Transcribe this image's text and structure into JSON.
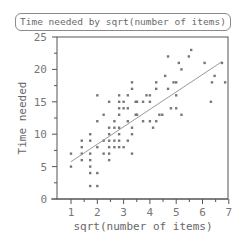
{
  "chart_data": {
    "type": "scatter",
    "title": "Time needed by sqrt(number of items)",
    "xlabel": "sqrt(number of items)",
    "ylabel": "Time needed",
    "xlim": [
      0.5,
      7
    ],
    "ylim": [
      0,
      25
    ],
    "xticks": [
      1,
      2,
      3,
      4,
      5,
      6,
      7
    ],
    "yticks": [
      0,
      5,
      10,
      15,
      20,
      25
    ],
    "grid": false,
    "legend": null,
    "points": [
      [
        1.0,
        7
      ],
      [
        1.0,
        5
      ],
      [
        1.41,
        9
      ],
      [
        1.41,
        8
      ],
      [
        1.41,
        7
      ],
      [
        1.41,
        6
      ],
      [
        1.73,
        10
      ],
      [
        1.73,
        9
      ],
      [
        1.73,
        7
      ],
      [
        1.73,
        6
      ],
      [
        1.73,
        5
      ],
      [
        1.73,
        4
      ],
      [
        1.73,
        2
      ],
      [
        2.0,
        16
      ],
      [
        2.0,
        12
      ],
      [
        2.0,
        8
      ],
      [
        2.0,
        4
      ],
      [
        2.0,
        2
      ],
      [
        2.24,
        13
      ],
      [
        2.24,
        9
      ],
      [
        2.24,
        7
      ],
      [
        2.45,
        15
      ],
      [
        2.45,
        11
      ],
      [
        2.45,
        10
      ],
      [
        2.45,
        9
      ],
      [
        2.45,
        8
      ],
      [
        2.45,
        7
      ],
      [
        2.45,
        6
      ],
      [
        2.65,
        12
      ],
      [
        2.65,
        11
      ],
      [
        2.65,
        9
      ],
      [
        2.65,
        8
      ],
      [
        2.83,
        16
      ],
      [
        2.83,
        15
      ],
      [
        2.83,
        14
      ],
      [
        2.83,
        13
      ],
      [
        2.83,
        11
      ],
      [
        2.83,
        10
      ],
      [
        2.83,
        9
      ],
      [
        2.83,
        8
      ],
      [
        3.0,
        15
      ],
      [
        3.0,
        14
      ],
      [
        3.0,
        8
      ],
      [
        3.16,
        16
      ],
      [
        3.16,
        14
      ],
      [
        3.16,
        12
      ],
      [
        3.16,
        9
      ],
      [
        3.32,
        18
      ],
      [
        3.32,
        17
      ],
      [
        3.32,
        11
      ],
      [
        3.32,
        10
      ],
      [
        3.32,
        7
      ],
      [
        3.46,
        15
      ],
      [
        3.46,
        13
      ],
      [
        3.51,
        15
      ],
      [
        3.51,
        13
      ],
      [
        3.74,
        15
      ],
      [
        3.74,
        12
      ],
      [
        3.87,
        16
      ],
      [
        4.0,
        16
      ],
      [
        4.0,
        15
      ],
      [
        4.0,
        12
      ],
      [
        4.12,
        11
      ],
      [
        4.24,
        18
      ],
      [
        4.24,
        17
      ],
      [
        4.24,
        12
      ],
      [
        4.36,
        13
      ],
      [
        4.47,
        13
      ],
      [
        4.58,
        19
      ],
      [
        4.69,
        22
      ],
      [
        4.69,
        17
      ],
      [
        4.8,
        14
      ],
      [
        4.9,
        18
      ],
      [
        5.0,
        18
      ],
      [
        5.0,
        16
      ],
      [
        5.0,
        14
      ],
      [
        5.1,
        21
      ],
      [
        5.2,
        20
      ],
      [
        5.2,
        13
      ],
      [
        5.48,
        22
      ],
      [
        5.57,
        23
      ],
      [
        6.08,
        21
      ],
      [
        6.32,
        15
      ],
      [
        6.36,
        18
      ],
      [
        6.46,
        19
      ],
      [
        6.74,
        21
      ],
      [
        6.86,
        18
      ]
    ],
    "regression_line": {
      "x": [
        1.0,
        6.74
      ],
      "y": [
        5.76,
        21.2
      ]
    }
  },
  "labels": {
    "title": "Time needed by sqrt(number of items)",
    "xlabel": "sqrt(number of items)",
    "ylabel": "Time needed"
  }
}
